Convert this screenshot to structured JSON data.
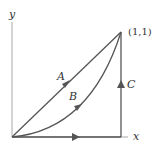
{
  "diagram": {
    "axes": {
      "x_label": "x",
      "y_label": "y"
    },
    "point_label": "(1,1)",
    "paths": [
      {
        "id": "A",
        "label": "A",
        "description": "straight line from origin to (1,1)"
      },
      {
        "id": "B",
        "label": "B",
        "description": "curve from origin to (1,1)"
      },
      {
        "id": "C",
        "label": "C",
        "description": "along x-axis to (1,0) then up to (1,1)"
      }
    ],
    "colors": {
      "line": "#555555",
      "axis": "#aaaaaa",
      "text": "#333333"
    }
  }
}
